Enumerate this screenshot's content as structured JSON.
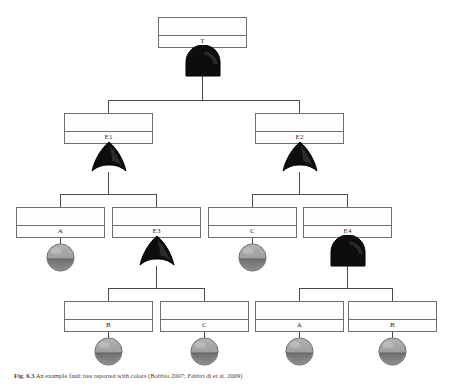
{
  "figure": {
    "number": "Fig. 6.3",
    "caption": "An example fault tree reported with colors (Bobbio 2007; Fabbri di et al. 2009)",
    "caption_full": "Fig. 6.3   An example of a fault tree, annotated with colors (Bobbio 2007; Fabbri di et al. 2009)"
  },
  "diagram": {
    "type": "fault-tree",
    "colors": {
      "box_stroke": "#6e6e6e",
      "box_fill": "#fefefe",
      "gate_fill": "#0d0d0d",
      "gate_stroke": "#000000",
      "connector": "#4a4a4a",
      "basic_event_fill_top": "#9e9e9e",
      "basic_event_fill_bottom": "#7d7d7d",
      "basic_event_stroke": "#6a6a6a"
    },
    "nodes": [
      {
        "id": "n-top",
        "label": "T",
        "kind": "event",
        "level": 0,
        "box": {
          "x": 158,
          "y": 17,
          "w": 89,
          "h": 31
        }
      },
      {
        "id": "n-e1",
        "label": "E1",
        "kind": "event",
        "level": 1,
        "box": {
          "x": 64,
          "y": 113,
          "w": 89,
          "h": 31
        }
      },
      {
        "id": "n-e2",
        "label": "E2",
        "kind": "event",
        "level": 1,
        "box": {
          "x": 255,
          "y": 113,
          "w": 89,
          "h": 31
        }
      },
      {
        "id": "n-a1",
        "label": "A",
        "kind": "event",
        "level": 2,
        "box": {
          "x": 16,
          "y": 207,
          "w": 89,
          "h": 31
        }
      },
      {
        "id": "n-e3",
        "label": "E3",
        "kind": "event",
        "level": 2,
        "box": {
          "x": 112,
          "y": 207,
          "w": 89,
          "h": 31
        }
      },
      {
        "id": "n-c1",
        "label": "C",
        "kind": "event",
        "level": 2,
        "box": {
          "x": 208,
          "y": 207,
          "w": 89,
          "h": 31
        }
      },
      {
        "id": "n-e4",
        "label": "E4",
        "kind": "event",
        "level": 2,
        "box": {
          "x": 303,
          "y": 207,
          "w": 89,
          "h": 31
        }
      },
      {
        "id": "n-b2",
        "label": "B",
        "kind": "event",
        "level": 3,
        "box": {
          "x": 64,
          "y": 301,
          "w": 89,
          "h": 31
        }
      },
      {
        "id": "n-c2",
        "label": "C",
        "kind": "event",
        "level": 3,
        "box": {
          "x": 160,
          "y": 301,
          "w": 89,
          "h": 31
        }
      },
      {
        "id": "n-a2",
        "label": "A",
        "kind": "event",
        "level": 3,
        "box": {
          "x": 255,
          "y": 301,
          "w": 89,
          "h": 31
        }
      },
      {
        "id": "n-b3",
        "label": "B",
        "kind": "event",
        "level": 3,
        "box": {
          "x": 348,
          "y": 301,
          "w": 89,
          "h": 31
        }
      }
    ],
    "gates": [
      {
        "id": "g-top",
        "type": "AND",
        "owner": "T",
        "cx": 202,
        "cy": 61
      },
      {
        "id": "g-e1",
        "type": "OR",
        "owner": "E1",
        "cx": 108,
        "cy": 157
      },
      {
        "id": "g-e2",
        "type": "OR",
        "owner": "E2",
        "cx": 299,
        "cy": 157
      },
      {
        "id": "g-e3",
        "type": "OR",
        "owner": "E3",
        "cx": 156,
        "cy": 251
      },
      {
        "id": "g-e4",
        "type": "AND",
        "owner": "E4",
        "cx": 347,
        "cy": 251
      }
    ],
    "basic_events": [
      {
        "id": "be-a1",
        "label": "A",
        "cx": 60,
        "cy": 257,
        "r": 14
      },
      {
        "id": "be-c1",
        "label": "C",
        "cx": 252,
        "cy": 257,
        "r": 14
      },
      {
        "id": "be-b2",
        "label": "B",
        "cx": 108,
        "cy": 351,
        "r": 14
      },
      {
        "id": "be-c2",
        "label": "C",
        "cx": 204,
        "cy": 351,
        "r": 14
      },
      {
        "id": "be-a2",
        "label": "A",
        "cx": 299,
        "cy": 351,
        "r": 14
      },
      {
        "id": "be-b3",
        "label": "B",
        "cx": 392,
        "cy": 351,
        "r": 14
      }
    ],
    "edges": [
      {
        "from": "g-top",
        "to": "n-e1"
      },
      {
        "from": "g-top",
        "to": "n-e2"
      },
      {
        "from": "g-e1",
        "to": "n-a1"
      },
      {
        "from": "g-e1",
        "to": "n-e3"
      },
      {
        "from": "g-e2",
        "to": "n-c1"
      },
      {
        "from": "g-e2",
        "to": "n-e4"
      },
      {
        "from": "g-e3",
        "to": "n-b2"
      },
      {
        "from": "g-e3",
        "to": "n-c2"
      },
      {
        "from": "g-e4",
        "to": "n-a2"
      },
      {
        "from": "g-e4",
        "to": "n-b3"
      }
    ]
  }
}
